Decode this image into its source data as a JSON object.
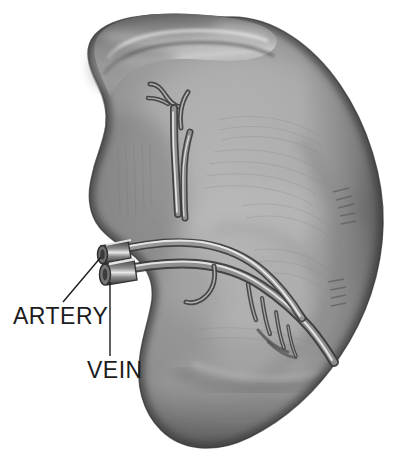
{
  "figure": {
    "view": "visceral surface with hilum",
    "style": "grayscale halftone anatomical illustration",
    "background_color": "#ffffff"
  },
  "labels": [
    {
      "id": "artery",
      "text": "ARTERY",
      "x": 13,
      "y": 305,
      "font_size": 23,
      "color": "#1c1c1c",
      "leader": {
        "name": "artery-leader-line",
        "from_x": 63,
        "from_y": 302,
        "to_x": 101,
        "to_y": 257,
        "color": "#1c1c1c",
        "width": 1.4
      }
    },
    {
      "id": "vein",
      "text": "VEIN",
      "x": 87,
      "y": 359,
      "font_size": 23,
      "color": "#1c1c1c",
      "leader": {
        "name": "vein-leader-line",
        "from_x": 110,
        "from_y": 356,
        "to_x": 110,
        "to_y": 282,
        "color": "#1c1c1c",
        "width": 1.4
      }
    }
  ],
  "palette": {
    "organ_mid": "#9a9a9a",
    "organ_light": "#b9b9b9",
    "organ_highlight": "#cfcfcf",
    "organ_shadow": "#6d6d6d",
    "organ_deep_shadow": "#4a4a4a",
    "organ_rim": "#3f3f3f",
    "vessel_dark": "#3a3a3a",
    "vessel_mid": "#7d7d7d",
    "vessel_highlight": "#e6e6e6",
    "line_color": "#1c1c1c"
  },
  "anatomy": {
    "parts": [
      {
        "name": "splenic-body",
        "description": "large ovoid organ mass occupying the frame"
      },
      {
        "name": "superior-border-fold",
        "description": "notched ridge along the upper left margin"
      },
      {
        "name": "hilum",
        "description": "central depression where vessels enter"
      },
      {
        "name": "splenic-artery-stump",
        "description": "cut vessel stump at left of hilum"
      },
      {
        "name": "splenic-vein-stump",
        "description": "cut vessel stump below the artery"
      },
      {
        "name": "superior-vessel-branch",
        "description": "Y-shaped branching vessel ascending from hilum"
      },
      {
        "name": "inferior-vessel-branches",
        "description": "comb-like branches descending to lower right"
      }
    ]
  }
}
